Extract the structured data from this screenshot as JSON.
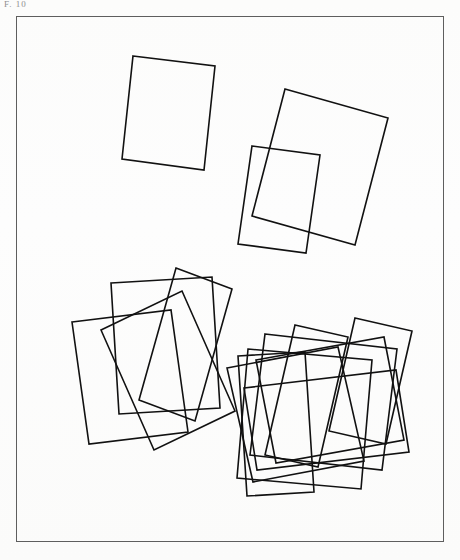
{
  "figure": {
    "caption": "F. 10",
    "background_color": "#fdfdfc",
    "stroke_color": "#111111",
    "frame_color": "#5e5e5e",
    "frame": {
      "x": 16,
      "y": 16,
      "width": 428,
      "height": 526
    },
    "canvas": {
      "width": 460,
      "height": 560
    },
    "groups": [
      {
        "id": "group-1",
        "label": "cluster-1-rect",
        "count": 1,
        "rectangles": [
          {
            "name": "rect-1-a",
            "points": "133,56 215,66 204,170 122,159"
          }
        ]
      },
      {
        "id": "group-2",
        "label": "cluster-2-rects",
        "count": 2,
        "rectangles": [
          {
            "name": "rect-2-a",
            "points": "285,89 388,118 355,245 252,216"
          },
          {
            "name": "rect-2-b",
            "points": "252,146 320,155 306,253 238,244"
          }
        ]
      },
      {
        "id": "group-3",
        "label": "cluster-4-rects",
        "count": 4,
        "rectangles": [
          {
            "name": "rect-3-a",
            "points": "111,283 212,277 220,408 119,414"
          },
          {
            "name": "rect-3-b",
            "points": "72,322 171,310 188,432 89,444"
          },
          {
            "name": "rect-3-c",
            "points": "176,268 232,289 195,421 139,400"
          },
          {
            "name": "rect-3-d",
            "points": "101,330 182,291 235,411 154,450"
          }
        ]
      },
      {
        "id": "group-4",
        "label": "cluster-8-rects",
        "count": 8,
        "rectangles": [
          {
            "name": "rect-4-a",
            "points": "295,325 348,337 318,467 265,455"
          },
          {
            "name": "rect-4-b",
            "points": "265,334 397,349 382,470 250,455"
          },
          {
            "name": "rect-4-c",
            "points": "248,349 372,360 361,489 237,478"
          },
          {
            "name": "rect-4-d",
            "points": "238,356 305,352 314,492 247,496"
          },
          {
            "name": "rect-4-e",
            "points": "355,318 412,331 386,444 329,431"
          },
          {
            "name": "rect-4-f",
            "points": "227,368 338,347 364,461 253,482"
          },
          {
            "name": "rect-4-g",
            "points": "244,388 396,370 409,452 257,470"
          },
          {
            "name": "rect-4-h",
            "points": "256,360 384,337 404,440 276,463"
          }
        ]
      }
    ]
  }
}
